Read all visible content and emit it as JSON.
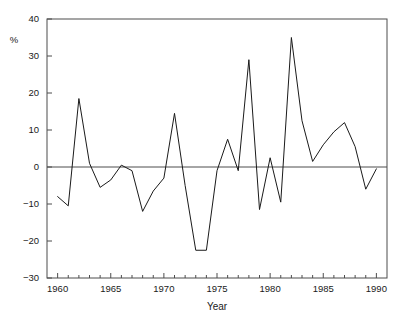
{
  "chart_data": {
    "type": "line",
    "title": "",
    "xlabel": "Year",
    "ylabel": "%",
    "xlim": [
      1959,
      1991
    ],
    "ylim": [
      -30,
      40
    ],
    "grid": false,
    "legend": "none",
    "x_major_ticks": [
      1960,
      1965,
      1970,
      1975,
      1980,
      1985,
      1990
    ],
    "x_major_tick_labels": [
      "1960",
      "1965",
      "1970",
      "1975",
      "1980",
      "1985",
      "1990"
    ],
    "x_minor_tick_step": 1,
    "y_ticks": [
      -30,
      -20,
      -10,
      0,
      10,
      20,
      30,
      40
    ],
    "y_tick_labels": [
      "-30",
      "-20",
      "-10",
      "0",
      "10",
      "20",
      "30",
      "40"
    ],
    "zero_line": 0,
    "line_color": "#1a1a1a",
    "axis_color": "#4d4d4d",
    "background": "#ffffff",
    "x": [
      1960,
      1961,
      1962,
      1963,
      1964,
      1965,
      1966,
      1967,
      1968,
      1969,
      1970,
      1971,
      1972,
      1973,
      1974,
      1975,
      1976,
      1977,
      1978,
      1979,
      1980,
      1981,
      1982,
      1983,
      1984,
      1985,
      1986,
      1987,
      1988,
      1989,
      1990
    ],
    "values": [
      -8.0,
      -10.5,
      18.5,
      1.0,
      -5.5,
      -3.5,
      0.5,
      -1.0,
      -12.0,
      -6.5,
      -3.0,
      14.5,
      -5.0,
      -22.5,
      -22.5,
      -1.0,
      7.5,
      -1.0,
      29.0,
      -11.5,
      2.5,
      -9.5,
      35.0,
      12.5,
      1.5,
      6.0,
      9.5,
      12.0,
      5.5,
      -6.0,
      -0.5
    ],
    "series": [
      {
        "name": "series-1",
        "values": [
          -8.0,
          -10.5,
          18.5,
          1.0,
          -5.5,
          -3.5,
          0.5,
          -1.0,
          -12.0,
          -6.5,
          -3.0,
          14.5,
          -5.0,
          -22.5,
          -22.5,
          -1.0,
          7.5,
          -1.0,
          29.0,
          -11.5,
          2.5,
          -9.5,
          35.0,
          12.5,
          1.5,
          6.0,
          9.5,
          12.0,
          5.5,
          -6.0,
          -0.5
        ]
      }
    ]
  },
  "labels": {
    "x_axis_title": "Year",
    "y_axis_title": "%"
  }
}
